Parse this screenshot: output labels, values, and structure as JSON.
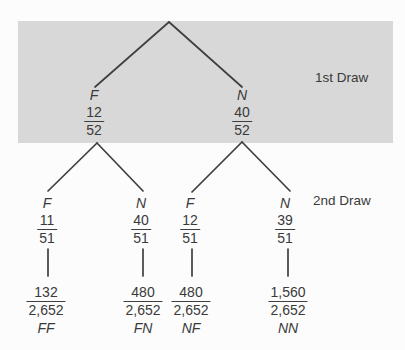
{
  "figure": {
    "type": "probability-tree",
    "stages": {
      "first_draw_label": "1st Draw",
      "second_draw_label": "2nd Draw"
    }
  },
  "level1": [
    {
      "label": "F",
      "numerator": "12",
      "denominator": "52"
    },
    {
      "label": "N",
      "numerator": "40",
      "denominator": "52"
    }
  ],
  "level2": [
    {
      "label": "F",
      "numerator": "11",
      "denominator": "51"
    },
    {
      "label": "N",
      "numerator": "40",
      "denominator": "51"
    },
    {
      "label": "F",
      "numerator": "12",
      "denominator": "51"
    },
    {
      "label": "N",
      "numerator": "39",
      "denominator": "51"
    }
  ],
  "outcomes": [
    {
      "numerator": "132",
      "denominator": "2,652",
      "label": "FF"
    },
    {
      "numerator": "480",
      "denominator": "2,652",
      "label": "FN"
    },
    {
      "numerator": "480",
      "denominator": "2,652",
      "label": "NF"
    },
    {
      "numerator": "1,560",
      "denominator": "2,652",
      "label": "NN"
    }
  ],
  "colors": {
    "band": "#d8d8d8",
    "line": "#3f3f3f",
    "text": "#3a3a3a",
    "background": "#fcfcfc"
  }
}
